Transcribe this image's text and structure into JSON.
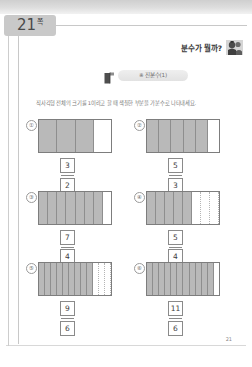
{
  "page_tab": {
    "number": "21",
    "suffix": "쪽"
  },
  "header": {
    "question": "분수가 뭘까?",
    "mascot_icon": "student-character-icon"
  },
  "banner": {
    "flag_icon": "flag-icon",
    "title": "※ 진분수(1)"
  },
  "instruction": "직사각형 전체의 크기를 1이라고 할 때 색칠한 부분을 가분수로 나타내세요.",
  "footer": {
    "page_number": "21"
  },
  "colors": {
    "shaded": "#b9b9b9",
    "outline": "#7d7d7d",
    "tab_background": "#c9c9c9",
    "text": "#3d3d3d"
  },
  "problems": [
    {
      "number": "①",
      "total_cells": 4,
      "shaded_cells": 3,
      "dotted_unshaded": false,
      "numerator": "3",
      "denominator": "2"
    },
    {
      "number": "②",
      "total_cells": 6,
      "shaded_cells": 5,
      "dotted_unshaded": false,
      "numerator": "5",
      "denominator": "3"
    },
    {
      "number": "③",
      "total_cells": 8,
      "shaded_cells": 7,
      "dotted_unshaded": false,
      "numerator": "7",
      "denominator": "4"
    },
    {
      "number": "④",
      "total_cells": 8,
      "shaded_cells": 5,
      "dotted_unshaded": true,
      "numerator": "5",
      "denominator": "4"
    },
    {
      "number": "⑤",
      "total_cells": 12,
      "shaded_cells": 9,
      "dotted_unshaded": true,
      "numerator": "9",
      "denominator": "6"
    },
    {
      "number": "⑥",
      "total_cells": 12,
      "shaded_cells": 11,
      "dotted_unshaded": false,
      "numerator": "11",
      "denominator": "6"
    }
  ]
}
